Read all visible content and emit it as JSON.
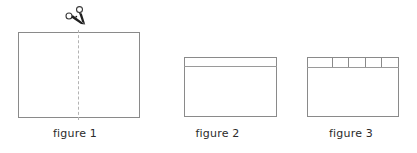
{
  "diagram": {
    "background_color": "#ffffff",
    "stroke_color": "#8a8a8a",
    "dashed_line_color": "#b3b3b3",
    "caption_color": "#2b2b2b",
    "figures": [
      {
        "id": "figure-1",
        "caption": "figure 1",
        "shape": "rectangle",
        "cut_line": {
          "orientation": "vertical",
          "style": "dashed",
          "position": "center"
        },
        "icon": "scissors-icon",
        "icon_position": "top-center-on-cut-line"
      },
      {
        "id": "figure-2",
        "caption": "figure 2",
        "shape": "rectangle",
        "bands": 1,
        "band_position": "top",
        "band_divisions": 1
      },
      {
        "id": "figure-3",
        "caption": "figure 3",
        "shape": "rectangle",
        "bands": 1,
        "band_position": "top",
        "band_divisions": 5,
        "band_cells": [
          {
            "label": "",
            "width_pct": 28
          },
          {
            "label": "",
            "width_pct": 18
          },
          {
            "label": "",
            "width_pct": 18
          },
          {
            "label": "",
            "width_pct": 18
          },
          {
            "label": "",
            "width_pct": 18
          }
        ]
      }
    ]
  }
}
